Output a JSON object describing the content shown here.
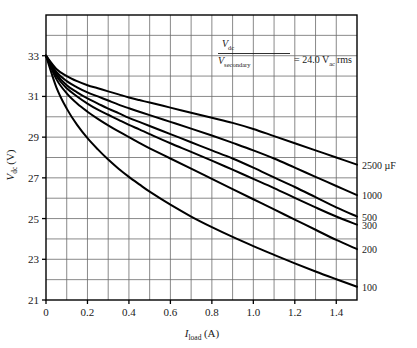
{
  "chart_data": {
    "type": "line",
    "title": "",
    "xlabel": "I_load (A)",
    "ylabel": "V_dc (V)",
    "xlim": [
      0,
      1.5
    ],
    "ylim": [
      21,
      35
    ],
    "grid": true,
    "grid_x_step": 0.1,
    "grid_y_step": 1,
    "xticks": [
      0,
      0.2,
      0.4,
      0.6,
      0.8,
      1.0,
      1.2,
      1.4
    ],
    "xtick_labels": [
      "0",
      "0.2",
      "0.4",
      "0.6",
      "0.8",
      "1.0",
      "1.2",
      "1.4"
    ],
    "yticks": [
      21,
      23,
      25,
      27,
      29,
      31,
      33
    ],
    "ytick_labels": [
      "21",
      "23",
      "25",
      "27",
      "29",
      "31",
      "33"
    ],
    "legend_position": "right-of-axes-at-curve-ends",
    "annotation": {
      "numerator": "V",
      "numerator_sub": "dc",
      "denominator": "V",
      "denominator_sub": "secondary",
      "equals": "=",
      "value": "24.0",
      "unit": "V",
      "unit_sub": "ac",
      "unit_suffix": "rms",
      "full_text": "Vdc / Vsecondary = 24.0 Vac rms"
    },
    "x": [
      0,
      0.05,
      0.1,
      0.15,
      0.2,
      0.25,
      0.3,
      0.35,
      0.4,
      0.45,
      0.5,
      0.6,
      0.7,
      0.8,
      0.9,
      1.0,
      1.1,
      1.2,
      1.3,
      1.4,
      1.5
    ],
    "series": [
      {
        "name": "2500 µF",
        "label": "2500 µF",
        "color": "#000000",
        "values": [
          33.0,
          32.35,
          32.0,
          31.75,
          31.55,
          31.4,
          31.25,
          31.1,
          30.95,
          30.82,
          30.7,
          30.45,
          30.2,
          29.95,
          29.7,
          29.4,
          29.05,
          28.7,
          28.35,
          28.0,
          27.65
        ]
      },
      {
        "name": "1000",
        "label": "1000",
        "color": "#000000",
        "values": [
          33.0,
          32.2,
          31.75,
          31.45,
          31.2,
          31.0,
          30.8,
          30.6,
          30.42,
          30.25,
          30.08,
          29.75,
          29.42,
          29.08,
          28.72,
          28.35,
          27.95,
          27.5,
          27.05,
          26.6,
          26.15
        ]
      },
      {
        "name": "500",
        "label": "500",
        "color": "#000000",
        "values": [
          33.0,
          32.1,
          31.55,
          31.2,
          30.9,
          30.65,
          30.4,
          30.18,
          29.95,
          29.75,
          29.55,
          29.15,
          28.75,
          28.35,
          27.95,
          27.5,
          27.02,
          26.55,
          26.05,
          25.55,
          25.1
        ]
      },
      {
        "name": "300",
        "label": "300",
        "color": "#000000",
        "values": [
          33.0,
          32.0,
          31.4,
          31.0,
          30.65,
          30.35,
          30.1,
          29.85,
          29.6,
          29.38,
          29.15,
          28.7,
          28.28,
          27.85,
          27.4,
          26.95,
          26.5,
          26.02,
          25.55,
          25.1,
          24.7
        ]
      },
      {
        "name": "200",
        "label": "200",
        "color": "#000000",
        "values": [
          33.0,
          31.85,
          31.15,
          30.65,
          30.25,
          29.9,
          29.58,
          29.28,
          29.0,
          28.72,
          28.45,
          27.95,
          27.45,
          26.95,
          26.45,
          25.95,
          25.45,
          24.95,
          24.45,
          23.95,
          23.5
        ]
      },
      {
        "name": "100",
        "label": "100",
        "color": "#000000",
        "values": [
          33.0,
          31.45,
          30.4,
          29.6,
          28.95,
          28.4,
          27.9,
          27.45,
          27.05,
          26.68,
          26.32,
          25.68,
          25.1,
          24.58,
          24.1,
          23.65,
          23.22,
          22.8,
          22.4,
          22.02,
          21.65
        ]
      }
    ]
  },
  "chart_frame": {
    "border_color": "#000000",
    "grid_color": "#6b6b6b",
    "curve_color": "#000000"
  }
}
